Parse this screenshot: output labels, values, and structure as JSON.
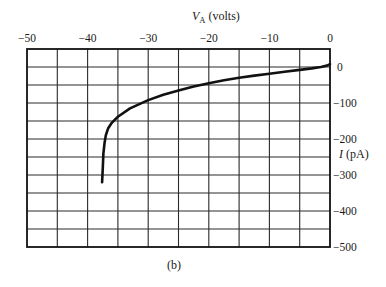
{
  "chart_data": {
    "type": "line",
    "title": "",
    "caption": "(b)",
    "xlabel": "V_A (volts)",
    "xlabel_main": "V",
    "xlabel_sub": "A",
    "xlabel_unit": " (volts)",
    "ylabel": "I (pA)",
    "ylabel_main": "I",
    "ylabel_unit": " (pA)",
    "xlim": [
      -50,
      0
    ],
    "ylim": [
      -500,
      50
    ],
    "x_axis_position": "top",
    "y_axis_position": "right",
    "xticks": [
      -50,
      -40,
      -30,
      -20,
      -10,
      0
    ],
    "xtick_labels": [
      "−50",
      "−40",
      "−30",
      "−20",
      "−10",
      "0"
    ],
    "yticks": [
      0,
      -100,
      -200,
      -300,
      -400,
      -500
    ],
    "ytick_labels": [
      "0",
      "−100",
      "−200",
      "−300",
      "−400",
      "−500"
    ],
    "grid": true,
    "grid_x_step": 5,
    "grid_y_step": 50,
    "series": [
      {
        "name": "I-V curve",
        "color": "#111111",
        "x": [
          -37.6,
          -37.5,
          -37.4,
          -37.2,
          -37.0,
          -36.6,
          -36.0,
          -35.0,
          -33.0,
          -30.0,
          -27.5,
          -25.0,
          -22.5,
          -20.0,
          -17.5,
          -15.0,
          -12.5,
          -10.0,
          -7.5,
          -5.0,
          -3.0,
          -1.5,
          -0.5,
          0.0
        ],
        "y": [
          -320,
          -280,
          -240,
          -210,
          -190,
          -170,
          -155,
          -138,
          -115,
          -92,
          -77,
          -65,
          -54,
          -45,
          -37,
          -30,
          -24,
          -19,
          -13,
          -8,
          -4,
          0,
          4,
          8
        ]
      }
    ]
  }
}
